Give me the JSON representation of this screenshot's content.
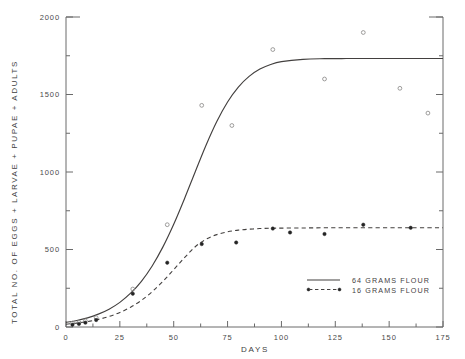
{
  "chart_data": {
    "type": "line",
    "title": "",
    "xlabel": "DAYS",
    "ylabel": "TOTAL  NO.  OF  EGGS  +  LARVAE  +  PUPAE  +  ADULTS",
    "xlim": [
      0,
      175
    ],
    "ylim": [
      0,
      2000
    ],
    "xticks": [
      0,
      25,
      50,
      75,
      100,
      125,
      150,
      175
    ],
    "xticklabels": [
      "0",
      "25",
      "50",
      "75",
      "100",
      "125",
      "150",
      "175"
    ],
    "yticks": [
      0,
      500,
      1000,
      1500,
      2000
    ],
    "yticklabels": [
      "0",
      "500",
      "1000",
      "1500",
      "2000"
    ],
    "yminorticks": [
      250,
      750,
      1250,
      1750
    ],
    "grid": false,
    "legend_position": "lower right",
    "series": [
      {
        "name": "64 GRAMS FLOUR",
        "label": "64  GRAMS  FLOUR",
        "style": "solid",
        "marker": "open-circle",
        "asymptote": 1730,
        "midpoint_day": 62,
        "growth_rate": 0.072,
        "fit_x": [
          0,
          5,
          10,
          15,
          20,
          25,
          30,
          35,
          40,
          45,
          50,
          55,
          60,
          65,
          70,
          75,
          80,
          85,
          90,
          95,
          100,
          110,
          120,
          130,
          140,
          150,
          160,
          175
        ],
        "fit_y": [
          30,
          42,
          59,
          83,
          115,
          159,
          218,
          295,
          394,
          517,
          663,
          828,
          1002,
          1173,
          1326,
          1452,
          1548,
          1617,
          1664,
          1694,
          1712,
          1727,
          1731,
          1732,
          1732,
          1732,
          1732,
          1732
        ],
        "points_x": [
          3,
          6,
          9,
          14,
          31,
          47,
          63,
          77,
          96,
          120,
          138,
          155,
          168
        ],
        "points_y": [
          25,
          30,
          40,
          60,
          245,
          660,
          1430,
          1300,
          1790,
          1600,
          1900,
          1540,
          1380
        ]
      },
      {
        "name": "16 GRAMS FLOUR",
        "label": "16  GRAMS  FLOUR",
        "style": "dashed",
        "marker": "filled-circle",
        "asymptote": 640,
        "midpoint_day": 58,
        "growth_rate": 0.068,
        "fit_x": [
          0,
          5,
          10,
          15,
          20,
          25,
          30,
          35,
          40,
          45,
          50,
          55,
          60,
          65,
          70,
          75,
          80,
          85,
          90,
          95,
          100,
          110,
          120,
          130,
          140,
          150,
          160,
          175
        ],
        "fit_y": [
          18,
          25,
          35,
          49,
          68,
          94,
          128,
          172,
          228,
          295,
          370,
          447,
          518,
          566,
          596,
          614,
          625,
          631,
          635,
          637,
          638,
          639,
          640,
          640,
          640,
          640,
          640,
          640
        ],
        "points_x": [
          3,
          6,
          9,
          14,
          31,
          47,
          63,
          79,
          96,
          104,
          120,
          138,
          160
        ],
        "points_y": [
          15,
          20,
          28,
          45,
          215,
          415,
          535,
          545,
          635,
          610,
          600,
          660,
          640
        ]
      }
    ]
  },
  "legend": {
    "entries": [
      {
        "label": "64  GRAMS  FLOUR",
        "style": "solid"
      },
      {
        "label": "16  GRAMS  FLOUR",
        "style": "dashed"
      }
    ]
  },
  "axes": {
    "x_title": "DAYS",
    "y_title_chars": [
      "T",
      "O",
      "T",
      "A",
      "L",
      " ",
      "N",
      "O",
      ".",
      "O",
      "F",
      " ",
      "E",
      "G",
      "G",
      "S",
      " ",
      "+",
      " ",
      "L",
      "A",
      "R",
      "V",
      "A",
      "E",
      " ",
      "+",
      " ",
      "P",
      "U",
      "P",
      "A",
      "E",
      " ",
      "+",
      " ",
      "A",
      "D",
      "U",
      "L",
      "T",
      "S"
    ],
    "y_title": "TOTAL  NO. OF  EGGS  +  LARVAE  +  PUPAE  +  ADULTS"
  }
}
